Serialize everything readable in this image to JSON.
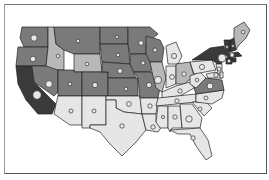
{
  "map": {
    "type": "choropleth-with-proportional-symbols",
    "region": "United States (contiguous)",
    "legend": null,
    "title": null,
    "shades": {
      "darkest": "#3a3a3a",
      "dark": "#5c5c5c",
      "medium": "#7a7a7a",
      "light": "#b8b8b8",
      "lightest": "#e6e6e6"
    },
    "states": [
      {
        "id": "WA",
        "shade": "medium",
        "points": "22,27 48,27 48,47 24,47 20,38",
        "circle": {
          "x": 34,
          "y": 38,
          "r": 3.2
        }
      },
      {
        "id": "OR",
        "shade": "medium",
        "points": "18,47 48,47 46,66 16,66",
        "circle": {
          "x": 33,
          "y": 59,
          "r": 2.8
        }
      },
      {
        "id": "CA",
        "shade": "darkest",
        "points": "16,66 32,66 34,82 56,104 52,114 38,114 26,100 18,84",
        "circle": {
          "x": 37,
          "y": 95,
          "r": 4.2
        }
      },
      {
        "id": "ID",
        "shade": "light",
        "points": "48,27 54,27 56,44 64,50 64,70 46,70 46,66 48,47",
        "circle": {
          "x": 58,
          "y": 56,
          "r": 1.8
        }
      },
      {
        "id": "NV",
        "shade": "medium",
        "points": "32,66 46,66 58,70 58,92 54,96 34,82",
        "circle": {
          "x": 49,
          "y": 84,
          "r": 3.4
        }
      },
      {
        "id": "MT",
        "shade": "medium",
        "points": "54,27 100,27 100,54 74,54 64,50 56,44",
        "circle": {
          "x": 78,
          "y": 41,
          "r": 1.8
        }
      },
      {
        "id": "WY",
        "shade": "light",
        "points": "74,54 100,54 102,72 74,72",
        "circle": {
          "x": 87,
          "y": 64,
          "r": 1.8
        }
      },
      {
        "id": "UT",
        "shade": "medium",
        "points": "58,70 74,70 74,72 82,72 82,96 58,96",
        "circle": {
          "x": 70,
          "y": 84,
          "r": 1.8
        }
      },
      {
        "id": "AZ",
        "shade": "lightest",
        "points": "58,96 82,96 82,125 70,125 54,114 56,104",
        "circle": {
          "x": 71,
          "y": 111,
          "r": 2
        }
      },
      {
        "id": "CO",
        "shade": "medium",
        "points": "82,72 108,72 108,96 82,96",
        "circle": {
          "x": 95,
          "y": 85,
          "r": 2.6
        }
      },
      {
        "id": "NM",
        "shade": "lightest",
        "points": "82,96 106,96 106,125 90,125 90,128 82,128",
        "circle": {
          "x": 94,
          "y": 111,
          "r": 2
        }
      },
      {
        "id": "ND",
        "shade": "medium",
        "points": "100,27 128,27 128,44 100,44",
        "circle": {
          "x": 117,
          "y": 37,
          "r": 1.6
        }
      },
      {
        "id": "SD",
        "shade": "medium",
        "points": "100,44 128,44 130,64 102,62",
        "circle": {
          "x": 118,
          "y": 55,
          "r": 1.8
        }
      },
      {
        "id": "NE",
        "shade": "medium",
        "points": "102,62 130,64 136,78 108,78 108,72 102,72",
        "circle": {
          "x": 120,
          "y": 71,
          "r": 2.4
        }
      },
      {
        "id": "KS",
        "shade": "medium",
        "points": "108,78 138,78 138,96 108,96",
        "circle": {
          "x": 126,
          "y": 89,
          "r": 1.8
        }
      },
      {
        "id": "OK",
        "shade": "lightest",
        "points": "106,96 140,96 142,114 124,112 116,108 116,100 106,100",
        "circle": {
          "x": 129,
          "y": 104,
          "r": 2.4
        }
      },
      {
        "id": "TX",
        "shade": "lightest",
        "points": "106,100 116,100 116,108 124,112 142,114 146,130 136,142 122,156 110,144 100,132 90,128 90,125 106,125",
        "circle": {
          "x": 122,
          "y": 126,
          "r": 2.2
        }
      },
      {
        "id": "MN",
        "shade": "medium",
        "points": "128,27 150,27 158,34 146,44 146,54 130,54 128,44",
        "circle": {
          "x": 141,
          "y": 43,
          "r": 2.4
        }
      },
      {
        "id": "IA",
        "shade": "medium",
        "points": "130,54 150,54 154,64 150,72 134,72 130,64",
        "circle": {
          "x": 143,
          "y": 63,
          "r": 2
        }
      },
      {
        "id": "MO",
        "shade": "medium",
        "points": "134,72 152,72 160,88 158,98 140,98 138,78",
        "circle": {
          "x": 149,
          "y": 85,
          "r": 2.6
        }
      },
      {
        "id": "AR",
        "shade": "lightest",
        "points": "140,98 158,98 156,114 142,114",
        "circle": {
          "x": 150,
          "y": 106,
          "r": 2.2
        }
      },
      {
        "id": "LA",
        "shade": "lightest",
        "points": "142,114 156,114 156,122 162,126 158,132 146,130",
        "circle": {
          "x": 153,
          "y": 127,
          "r": 2.2
        }
      },
      {
        "id": "WI",
        "shade": "medium",
        "points": "146,36 160,40 164,48 162,62 150,62 146,54 146,44",
        "circle": {
          "x": 155,
          "y": 50,
          "r": 2
        }
      },
      {
        "id": "IL",
        "shade": "light",
        "points": "150,62 162,62 166,78 162,92 156,88 152,72",
        "circle": {
          "x": 158,
          "y": 80,
          "r": 3.6
        }
      },
      {
        "id": "MI",
        "shade": "lightest",
        "points": "166,46 176,42 182,56 178,64 168,64",
        "circle": {
          "x": 174,
          "y": 56,
          "r": 2.6
        }
      },
      {
        "id": "IN",
        "shade": "lightest",
        "points": "166,66 176,66 176,84 166,88",
        "circle": {
          "x": 172,
          "y": 77,
          "r": 2.4
        }
      },
      {
        "id": "OH",
        "shade": "light",
        "points": "176,64 190,62 194,76 184,84 176,84",
        "circle": {
          "x": 184,
          "y": 74,
          "r": 2.2
        }
      },
      {
        "id": "KY",
        "shade": "lightest",
        "points": "162,92 176,86 190,82 194,88 180,96 162,98",
        "circle": {
          "x": 180,
          "y": 91,
          "r": 2.2
        }
      },
      {
        "id": "TN",
        "shade": "lightest",
        "points": "158,98 196,94 196,102 156,106",
        "circle": {
          "x": 177,
          "y": 101,
          "r": 2.2
        }
      },
      {
        "id": "MS",
        "shade": "lightest",
        "points": "158,106 168,106 168,128 160,128 156,122",
        "circle": {
          "x": 163,
          "y": 117,
          "r": 1.6
        }
      },
      {
        "id": "AL",
        "shade": "lightest",
        "points": "168,106 180,106 182,128 172,128 170,132 168,128",
        "circle": {
          "x": 175,
          "y": 117,
          "r": 2.2
        }
      },
      {
        "id": "GA",
        "shade": "lightest",
        "points": "180,104 192,104 202,118 200,128 182,128",
        "circle": {
          "x": 189,
          "y": 119,
          "r": 3.2
        }
      },
      {
        "id": "FL",
        "shade": "lightest",
        "points": "170,130 200,128 208,140 212,156 206,160 196,146 190,134 178,134",
        "circle": {
          "x": 193,
          "y": 138,
          "r": 2.2
        }
      },
      {
        "id": "SC",
        "shade": "lightest",
        "points": "192,102 206,102 212,108 204,116",
        "circle": {
          "x": 200,
          "y": 109,
          "r": 2
        }
      },
      {
        "id": "NC",
        "shade": "lightest",
        "points": "196,94 224,90 222,98 212,104 196,102",
        "circle": {
          "x": 206,
          "y": 98,
          "r": 2
        }
      },
      {
        "id": "VA",
        "shade": "medium",
        "points": "194,88 206,78 222,80 224,90 196,94",
        "circle": {
          "x": 210,
          "y": 86,
          "r": 3
        }
      },
      {
        "id": "WV",
        "shade": "lightest",
        "points": "190,76 200,72 206,78 196,88 190,84",
        "circle": {
          "x": 197,
          "y": 80,
          "r": 1.8
        }
      },
      {
        "id": "PA",
        "shade": "lightest",
        "points": "190,62 212,60 216,70 194,74",
        "circle": {
          "x": 202,
          "y": 67,
          "r": 2.6
        }
      },
      {
        "id": "NY",
        "shade": "darkest",
        "points": "192,60 210,48 224,46 226,56 220,66 212,60",
        "circle": {
          "x": 222,
          "y": 58,
          "r": 4
        }
      },
      {
        "id": "MD",
        "shade": "lightest",
        "points": "206,74 216,72 222,78 208,78",
        "circle": {
          "x": 216,
          "y": 75,
          "r": 2.2
        }
      },
      {
        "id": "NJ",
        "shade": "lightest",
        "points": "216,64 222,64 222,74 218,74",
        "circle": {
          "x": 219,
          "y": 69,
          "r": 2
        }
      },
      {
        "id": "DE",
        "shade": "lightest",
        "points": "220,72 223,72 223,78 220,78",
        "circle": null
      },
      {
        "id": "VT",
        "shade": "darkest",
        "points": "224,40 230,40 230,52 226,54",
        "circle": {
          "x": 227,
          "y": 47,
          "r": 1.4
        }
      },
      {
        "id": "NH",
        "shade": "darkest",
        "points": "230,40 234,38 236,50 230,52",
        "circle": {
          "x": 233,
          "y": 46,
          "r": 1.4
        }
      },
      {
        "id": "ME",
        "shade": "light",
        "points": "234,28 244,22 250,30 246,38 238,46 236,50 234,38",
        "circle": {
          "x": 243,
          "y": 32,
          "r": 1.8
        }
      },
      {
        "id": "MA",
        "shade": "darkest",
        "points": "226,54 238,52 242,56 228,58",
        "circle": {
          "x": 232,
          "y": 55,
          "r": 2.2
        }
      },
      {
        "id": "CT",
        "shade": "darkest",
        "points": "226,58 232,58 232,64 226,64",
        "circle": {
          "x": 229,
          "y": 61,
          "r": 1.8
        }
      },
      {
        "id": "RI",
        "shade": "darkest",
        "points": "232,58 236,58 236,62 232,62",
        "circle": null
      }
    ]
  }
}
